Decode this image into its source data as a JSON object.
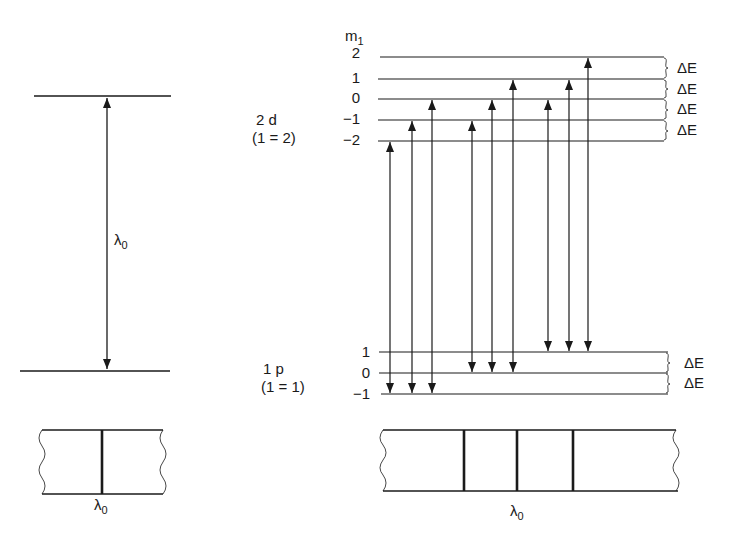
{
  "colors": {
    "ink": "#1a1a1a",
    "background": "#ffffff"
  },
  "left": {
    "transition_label": "λ",
    "transition_sub": "0",
    "spectrum_label": "λ",
    "spectrum_sub": "0"
  },
  "upper_state": {
    "name": "2 d",
    "quantum": "(1 = 2)",
    "ml_header": "m",
    "ml_header_sub": "1",
    "levels": [
      "2",
      "1",
      "0",
      "−1",
      "−2"
    ],
    "spacing_labels": [
      "ΔE",
      "ΔE",
      "ΔE",
      "ΔE"
    ]
  },
  "lower_state": {
    "name": "1 p",
    "quantum": "(1 = 1)",
    "levels": [
      "1",
      "0",
      "−1"
    ],
    "spacing_labels": [
      "ΔE",
      "ΔE"
    ]
  },
  "right": {
    "spectrum_label": "λ",
    "spectrum_sub": "0"
  }
}
